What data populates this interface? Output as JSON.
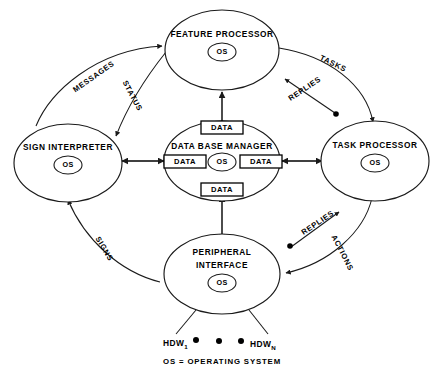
{
  "diagram": {
    "legend": {
      "text": "OS = OPERATING SYSTEM",
      "os_abbrev": "OS"
    },
    "nodes": [
      {
        "id": "feature-processor",
        "label_line1": "FEATURE PROCESSOR",
        "label_line2": "",
        "os": "OS"
      },
      {
        "id": "sign-interpreter",
        "label_line1": "SIGN INTERPRETER",
        "label_line2": "",
        "os": "OS"
      },
      {
        "id": "data-base-manager",
        "label_line1": "DATA BASE MANAGER",
        "label_line2": "",
        "os": "OS"
      },
      {
        "id": "task-processor",
        "label_line1": "TASK PROCESSOR",
        "label_line2": "",
        "os": "OS"
      },
      {
        "id": "peripheral-interface",
        "label_line1": "PERIPHERAL",
        "label_line2": "INTERFACE",
        "os": "OS"
      }
    ],
    "data_boxes": [
      {
        "id": "data-top",
        "label": "DATA"
      },
      {
        "id": "data-left",
        "label": "DATA"
      },
      {
        "id": "data-right",
        "label": "DATA"
      },
      {
        "id": "data-bottom",
        "label": "DATA"
      }
    ],
    "edges": [
      {
        "id": "messages",
        "label": "MESSAGES",
        "from": "sign-interpreter",
        "to": "feature-processor"
      },
      {
        "id": "status",
        "label": "STATUS",
        "from": "feature-processor",
        "to": "sign-interpreter"
      },
      {
        "id": "tasks",
        "label": "TASKS",
        "from": "feature-processor",
        "to": "task-processor"
      },
      {
        "id": "replies-upper",
        "label": "REPLIES",
        "from": "task-processor",
        "to": "feature-processor"
      },
      {
        "id": "actions",
        "label": "ACTIONS",
        "from": "task-processor",
        "to": "peripheral-interface"
      },
      {
        "id": "replies-lower",
        "label": "REPLIES",
        "from": "peripheral-interface",
        "to": "task-processor"
      },
      {
        "id": "signs",
        "label": "SIGNS",
        "from": "peripheral-interface",
        "to": "sign-interpreter"
      }
    ],
    "hardware": {
      "first_base": "HDW",
      "first_sub": "1",
      "last_base": "HDW",
      "last_sub": "N",
      "ellipsis_dots": 3
    },
    "colors": {
      "stroke": "#1a1a1a",
      "fill": "#ffffff",
      "text": "#000000"
    }
  }
}
